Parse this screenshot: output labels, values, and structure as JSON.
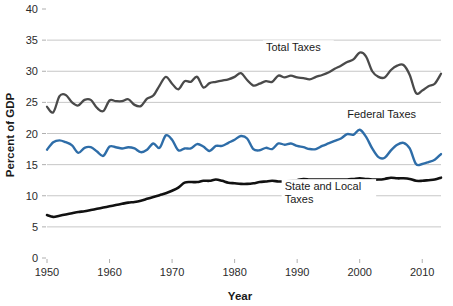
{
  "chart_data": {
    "type": "line",
    "title": "",
    "xlabel": "Year",
    "ylabel": "Percent of GDP",
    "xlim": [
      1950,
      2013
    ],
    "ylim": [
      0,
      40
    ],
    "grid": true,
    "legend_position": "inline-annotations",
    "xticks": [
      1950,
      1960,
      1970,
      1980,
      1990,
      2000,
      2010
    ],
    "xtick_labels": [
      "1950",
      "1960",
      "1970",
      "1980",
      "1990",
      "2000",
      "2010"
    ],
    "yticks": [
      0,
      5,
      10,
      15,
      20,
      25,
      30,
      35,
      40
    ],
    "ytick_labels": [
      "0",
      "5",
      "10",
      "15",
      "20",
      "25",
      "30",
      "35",
      "40"
    ],
    "x": [
      1950,
      1951,
      1952,
      1953,
      1954,
      1955,
      1956,
      1957,
      1958,
      1959,
      1960,
      1961,
      1962,
      1963,
      1964,
      1965,
      1966,
      1967,
      1968,
      1969,
      1970,
      1971,
      1972,
      1973,
      1974,
      1975,
      1976,
      1977,
      1978,
      1979,
      1980,
      1981,
      1982,
      1983,
      1984,
      1985,
      1986,
      1987,
      1988,
      1989,
      1990,
      1991,
      1992,
      1993,
      1994,
      1995,
      1996,
      1997,
      1998,
      1999,
      2000,
      2001,
      2002,
      2003,
      2004,
      2005,
      2006,
      2007,
      2008,
      2009,
      2010,
      2011,
      2012,
      2013
    ],
    "series": [
      {
        "name": "Total Taxes",
        "color": "#4a4a4a",
        "label": "Total Taxes",
        "label_x": 1985,
        "label_y": 33.2,
        "values": [
          24.3,
          23.4,
          26.0,
          26.2,
          25.0,
          24.5,
          25.4,
          25.4,
          24.1,
          23.6,
          25.3,
          25.2,
          25.2,
          25.5,
          24.6,
          24.4,
          25.6,
          26.1,
          27.7,
          29.1,
          28.0,
          27.1,
          28.4,
          28.3,
          29.1,
          27.4,
          28.1,
          28.3,
          28.5,
          28.7,
          29.1,
          29.7,
          28.6,
          27.7,
          28.0,
          28.4,
          28.3,
          29.3,
          29.0,
          29.3,
          29.0,
          28.9,
          28.7,
          29.1,
          29.4,
          29.8,
          30.4,
          30.9,
          31.5,
          31.9,
          33.0,
          32.4,
          30.0,
          29.1,
          29.0,
          30.2,
          30.9,
          31.0,
          29.4,
          26.5,
          26.9,
          27.6,
          28.0,
          29.6
        ]
      },
      {
        "name": "Federal Taxes",
        "color": "#2e6da8",
        "label": "Federal Taxes",
        "label_x": 1998,
        "label_y": 22.5,
        "values": [
          17.4,
          18.6,
          18.9,
          18.6,
          18.1,
          16.9,
          17.7,
          17.8,
          17.1,
          16.4,
          17.9,
          17.8,
          17.6,
          17.8,
          17.6,
          17.0,
          17.4,
          18.4,
          17.7,
          19.7,
          19.0,
          17.3,
          17.6,
          17.6,
          18.3,
          17.9,
          17.2,
          18.0,
          18.0,
          18.5,
          19.0,
          19.6,
          19.2,
          17.5,
          17.3,
          17.7,
          17.5,
          18.4,
          18.2,
          18.4,
          18.0,
          17.8,
          17.5,
          17.5,
          18.0,
          18.4,
          18.8,
          19.2,
          19.9,
          19.8,
          20.6,
          19.5,
          17.6,
          16.2,
          16.1,
          17.3,
          18.2,
          18.5,
          17.6,
          15.1,
          15.1,
          15.4,
          15.8,
          16.7
        ]
      },
      {
        "name": "State and Local Taxes",
        "color": "#111111",
        "label_lines": [
          "State and Local",
          "Taxes"
        ],
        "label_x": 1988,
        "label_y": 10.9,
        "values": [
          6.9,
          6.6,
          6.8,
          7.0,
          7.2,
          7.4,
          7.5,
          7.7,
          7.9,
          8.1,
          8.3,
          8.5,
          8.7,
          8.9,
          9.0,
          9.2,
          9.5,
          9.8,
          10.1,
          10.4,
          10.8,
          11.3,
          12.1,
          12.2,
          12.2,
          12.4,
          12.4,
          12.6,
          12.4,
          12.1,
          12.0,
          11.9,
          11.9,
          12.0,
          12.2,
          12.3,
          12.4,
          12.3,
          12.3,
          12.4,
          12.5,
          12.7,
          12.6,
          12.6,
          12.6,
          12.6,
          12.6,
          12.6,
          12.6,
          12.7,
          12.8,
          12.7,
          12.6,
          12.6,
          12.7,
          12.9,
          12.8,
          12.8,
          12.7,
          12.4,
          12.4,
          12.5,
          12.6,
          12.9
        ]
      }
    ]
  }
}
